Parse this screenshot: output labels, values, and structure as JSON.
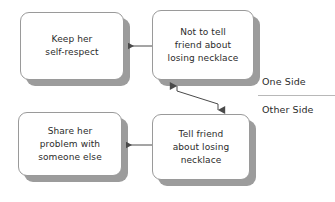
{
  "diagram": {
    "type": "two-sided-decision-flow",
    "nodes": [
      {
        "id": "keep-self-respect",
        "text": "Keep her\nself-respect",
        "side": "one-side",
        "column": "left",
        "row": "top"
      },
      {
        "id": "not-to-tell",
        "text": "Not to tell\nfriend about\nlosing necklace",
        "side": "one-side",
        "column": "right",
        "row": "top"
      },
      {
        "id": "share-problem",
        "text": "Share her\nproblem with\nsomeone else",
        "side": "other-side",
        "column": "left",
        "row": "bottom"
      },
      {
        "id": "tell-friend",
        "text": "Tell friend\nabout losing\nnecklace",
        "side": "other-side",
        "column": "right",
        "row": "bottom"
      }
    ],
    "connectors": [
      {
        "id": "not-tell-to-keep",
        "from": "not-to-tell",
        "to": "keep-self-respect",
        "direction": "left",
        "arrowheads": "end"
      },
      {
        "id": "tell-to-share",
        "from": "tell-friend",
        "to": "share-problem",
        "direction": "left",
        "arrowheads": "end"
      },
      {
        "id": "between-sides",
        "from": "not-to-tell",
        "to": "tell-friend",
        "direction": "diagonal",
        "arrowheads": "both"
      }
    ],
    "side_labels": {
      "one_side": "One Side",
      "other_side": "Other Side"
    },
    "colors": {
      "box_border": "#9a9a9a",
      "box_fill": "#ffffff",
      "shadow": "#9c9c9c",
      "text": "#2b2b2b",
      "connector": "#4a4a4a",
      "divider": "#b8b8b8",
      "background": "#ffffff"
    }
  }
}
